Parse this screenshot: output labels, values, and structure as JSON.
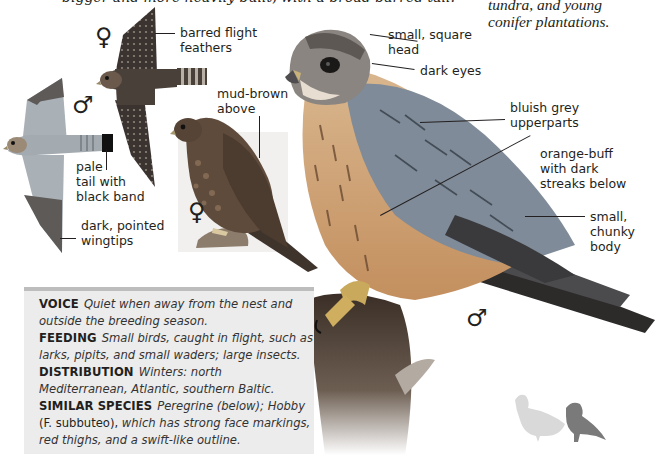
{
  "page": {
    "clipped_top_line": "bigger and more heavily built, with a broad barred tail.",
    "habitat_text": [
      "tundra, and young",
      "conifer plantations."
    ]
  },
  "illustrations": {
    "female_flight": {
      "sex_symbol": "♀",
      "labels": {
        "barred_flight_feathers": [
          "barred flight",
          "feathers"
        ]
      }
    },
    "male_flight": {
      "sex_symbol": "♂",
      "labels": {
        "pale_tail": [
          "pale",
          "tail with",
          "black band"
        ],
        "dark_wingtips": [
          "dark, pointed",
          "wingtips"
        ]
      }
    },
    "female_perched": {
      "sex_symbol": "♀",
      "labels": {
        "mud_brown": [
          "mud-brown",
          "above"
        ]
      }
    },
    "male_perched": {
      "sex_symbol": "♂",
      "labels": {
        "square_head": [
          "small, square",
          "head"
        ],
        "dark_eyes": "dark eyes",
        "upperparts": [
          "bluish grey",
          "upperparts"
        ],
        "underparts": [
          "orange-buff",
          "with dark",
          "streaks below"
        ],
        "body": [
          "small,",
          "chunky",
          "body"
        ]
      }
    },
    "size_comparison": {
      "items": [
        "pigeon-silhouette",
        "merlin-silhouette"
      ]
    }
  },
  "info_box": {
    "entries": [
      {
        "key": "VOICE",
        "value": "Quiet when away from the nest and outside the breeding season."
      },
      {
        "key": "FEEDING",
        "value": "Small birds, caught in flight, such as larks, pipits, and small waders; large insects."
      },
      {
        "key": "DISTRIBUTION",
        "value": "Winters: north Mediterranean, Atlantic, southern Baltic."
      },
      {
        "key": "SIMILAR SPECIES",
        "value_part1": "Peregrine (below); Hobby",
        "value_plain": "(F. subbuteo),",
        "value_part2": "which has strong face markings, red thighs, and a swift-like outline."
      }
    ]
  },
  "colors": {
    "text": "#231f20",
    "box_bg": "#ececec",
    "box_rule": "#bdbdbd",
    "male_blue_grey": "#8e9aa6",
    "female_brown": "#5a4636",
    "buff": "#c9976a",
    "silhouette_light": "#d8d8d8",
    "silhouette_dark": "#7a7a7a"
  }
}
